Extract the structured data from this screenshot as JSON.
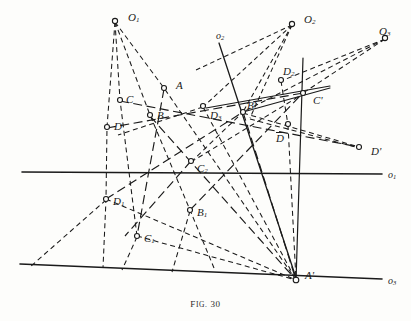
{
  "figure": {
    "caption_prefix": "F",
    "caption_smallcaps": "IG.",
    "caption_number": "30",
    "caption_full": "Fig. 30",
    "ink_color": "#1a1a1a",
    "background_color": "#fdfdfb"
  },
  "axes": [
    {
      "id": "o1",
      "label_base": "o",
      "label_sub": "1",
      "label_x": 388,
      "label_y": 170,
      "kind": "horizontal-axis"
    },
    {
      "id": "o2",
      "label_base": "o",
      "label_sub": "2",
      "label_x": 216,
      "label_y": 31,
      "kind": "oblique-axis"
    },
    {
      "id": "o3",
      "label_base": "o",
      "label_sub": "3",
      "label_x": 388,
      "label_y": 276,
      "kind": "lower-axis"
    }
  ],
  "centers": [
    {
      "id": "O1",
      "label_base": "O",
      "label_sub": "1",
      "label_x": 128,
      "label_y": 12,
      "marker_x": 115,
      "marker_y": 21
    },
    {
      "id": "O2",
      "label_base": "O",
      "label_sub": "2",
      "label_x": 304,
      "label_y": 14,
      "marker_x": 292,
      "marker_y": 24
    },
    {
      "id": "O3",
      "label_base": "O",
      "label_sub": "3",
      "label_x": 379,
      "label_y": 26,
      "marker_x": 385,
      "marker_y": 38
    }
  ],
  "points": [
    {
      "id": "A",
      "label_base": "A",
      "label_sub": "",
      "prime": "",
      "overbar": false,
      "label_x": 176,
      "label_y": 80,
      "marker_x": 164,
      "marker_y": 88
    },
    {
      "id": "B",
      "label_base": "B",
      "label_sub": "",
      "prime": "",
      "overbar": false,
      "label_x": 157,
      "label_y": 110,
      "marker_x": 150,
      "marker_y": 115
    },
    {
      "id": "C",
      "label_base": "C",
      "label_sub": "",
      "prime": "",
      "overbar": false,
      "label_x": 126,
      "label_y": 94,
      "marker_x": 120,
      "marker_y": 100
    },
    {
      "id": "D",
      "label_base": "D",
      "label_sub": "",
      "prime": "",
      "overbar": false,
      "label_x": 114,
      "label_y": 121,
      "marker_x": 107,
      "marker_y": 127
    },
    {
      "id": "D1",
      "label_base": "D",
      "label_sub": "1",
      "prime": "",
      "overbar": false,
      "label_x": 113,
      "label_y": 196,
      "marker_x": 106,
      "marker_y": 199
    },
    {
      "id": "C1",
      "label_base": "C",
      "label_sub": "1",
      "prime": "",
      "overbar": false,
      "label_x": 144,
      "label_y": 233,
      "marker_x": 137,
      "marker_y": 236
    },
    {
      "id": "B1",
      "label_base": "B",
      "label_sub": "1",
      "prime": "",
      "overbar": false,
      "label_x": 197,
      "label_y": 207,
      "marker_x": 190,
      "marker_y": 210
    },
    {
      "id": "C2",
      "label_base": "C",
      "label_sub": "2",
      "prime": "",
      "overbar": false,
      "label_x": 197,
      "label_y": 163,
      "marker_x": 191,
      "marker_y": 161
    },
    {
      "id": "D3",
      "label_base": "D",
      "label_sub": "3",
      "prime": "",
      "overbar": false,
      "label_x": 210,
      "label_y": 110,
      "marker_x": 203,
      "marker_y": 106
    },
    {
      "id": "D2",
      "label_base": "D",
      "label_sub": "2",
      "prime": "",
      "overbar": false,
      "label_x": 283,
      "label_y": 66,
      "marker_x": 281,
      "marker_y": 80
    },
    {
      "id": "Bp",
      "label_base": "B",
      "label_sub": "",
      "prime": "'",
      "overbar": false,
      "label_x": 247,
      "label_y": 100,
      "marker_x": 243,
      "marker_y": 112
    },
    {
      "id": "Cp",
      "label_base": "C",
      "label_sub": "",
      "prime": "'",
      "overbar": false,
      "label_x": 313,
      "label_y": 95,
      "marker_x": 303,
      "marker_y": 93
    },
    {
      "id": "Dbar",
      "label_base": "D",
      "label_sub": "",
      "prime": "",
      "overbar": true,
      "label_x": 276,
      "label_y": 132,
      "marker_x": 288,
      "marker_y": 124
    },
    {
      "id": "Dp",
      "label_base": "D",
      "label_sub": "",
      "prime": "'",
      "overbar": false,
      "label_x": 371,
      "label_y": 146,
      "marker_x": 359,
      "marker_y": 147
    },
    {
      "id": "Ap",
      "label_base": "A",
      "label_sub": "",
      "prime": "'",
      "overbar": false,
      "label_x": 305,
      "label_y": 270,
      "marker_x": 296,
      "marker_y": 280
    }
  ],
  "geometry": {
    "description": "Projective construction with three centers of perspectivity and three axes",
    "axis_lines": [
      {
        "name": "o1-horizontal",
        "x1": 22,
        "y1": 172,
        "x2": 382,
        "y2": 174
      },
      {
        "name": "o2-oblique",
        "x1": 219,
        "y1": 43,
        "x2": 297,
        "y2": 281
      },
      {
        "name": "o3-lower",
        "x1": 20,
        "y1": 264,
        "x2": 382,
        "y2": 279
      },
      {
        "name": "vertical-CA",
        "x1": 303,
        "y1": 58,
        "x2": 296,
        "y2": 281
      }
    ]
  }
}
